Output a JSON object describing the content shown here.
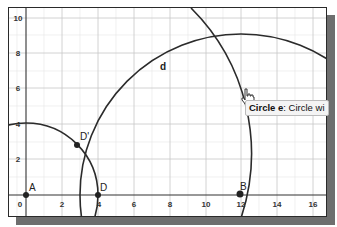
{
  "graph": {
    "x_ticks": [
      {
        "label": "0",
        "x": 11
      },
      {
        "label": "2",
        "x": 53
      },
      {
        "label": "4",
        "x": 89
      },
      {
        "label": "6",
        "x": 125
      },
      {
        "label": "8",
        "x": 161
      },
      {
        "label": "10",
        "x": 197
      },
      {
        "label": "12",
        "x": 232
      },
      {
        "label": "14",
        "x": 268
      },
      {
        "label": "16",
        "x": 304
      }
    ],
    "y_ticks": [
      {
        "label": "10",
        "y": 10
      },
      {
        "label": "8",
        "y": 45
      },
      {
        "label": "6",
        "y": 80
      },
      {
        "label": "4",
        "y": 116
      },
      {
        "label": "2",
        "y": 151
      }
    ],
    "points": {
      "A": {
        "label": "A"
      },
      "B": {
        "label": "B"
      },
      "D": {
        "label": "D"
      },
      "D_prime": {
        "label": "D'"
      }
    },
    "objects": {
      "d": {
        "label": "d"
      }
    }
  },
  "tooltip": {
    "object_name": "Circle e",
    "text": ": Circle wi"
  },
  "colors": {
    "curve": "#2b2b2b",
    "grid_minor": "#e4e4e4",
    "grid_major": "#c9c9c9",
    "axis": "#333333",
    "shadow": "#6e6e6e"
  }
}
